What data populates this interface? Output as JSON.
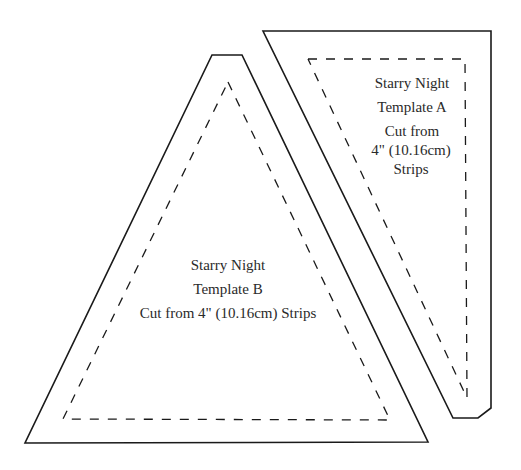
{
  "templates": [
    {
      "id": "A",
      "lines": [
        "Starry Night",
        "Template A",
        "Cut from",
        "4\" (10.16cm)",
        "Strips"
      ]
    },
    {
      "id": "B",
      "lines": [
        "Starry Night",
        "Template B",
        "Cut from 4\" (10.16cm) Strips"
      ]
    }
  ],
  "colors": {
    "line": "#1a1a1a",
    "text": "#2a2a2a",
    "background": "#ffffff"
  }
}
